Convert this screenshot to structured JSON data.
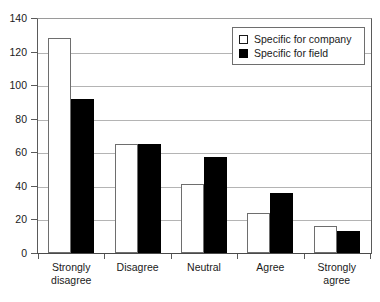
{
  "chart_data": {
    "type": "bar",
    "title": "",
    "subtitle": "",
    "xlabel": "",
    "ylabel": "",
    "categories": [
      "Strongly\ndisagree",
      "Disagree",
      "Neutral",
      "Agree",
      "Strongly\nagree"
    ],
    "series": [
      {
        "name": "Specific for company",
        "color": "#ffffff",
        "edge_color": "#6e6e6e",
        "values": [
          128,
          65,
          41,
          24,
          16
        ]
      },
      {
        "name": "Specific for field",
        "color": "#000000",
        "edge_color": "#000000",
        "values": [
          92,
          65,
          57,
          36,
          13
        ]
      }
    ],
    "ylim": [
      0,
      140
    ],
    "ytick_labels": [
      "0",
      "20",
      "40",
      "60",
      "80",
      "100",
      "120",
      "140"
    ],
    "ytick_values": [
      0,
      20,
      40,
      60,
      80,
      100,
      120,
      140
    ],
    "grid": "horizontal",
    "gridline_color": "#b4b4b4",
    "legend_position": "top-right-inside",
    "axis_color": "#5a5a5a",
    "text_color": "#1a1a1a"
  },
  "legend": {
    "entries": [
      {
        "label": "Specific for company",
        "swatch": "white-square"
      },
      {
        "label": "Specific for field",
        "swatch": "black-square"
      }
    ]
  }
}
